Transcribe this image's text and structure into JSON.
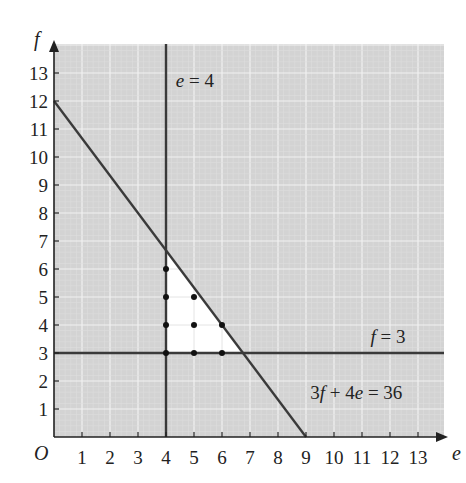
{
  "chart_data": {
    "type": "line",
    "title": "",
    "xlabel": "e",
    "ylabel": "f",
    "origin_label": "O",
    "xlim": [
      0,
      13.9
    ],
    "ylim": [
      0,
      13.9
    ],
    "x_ticks": [
      1,
      2,
      3,
      4,
      5,
      6,
      7,
      8,
      9,
      10,
      11,
      12,
      13
    ],
    "y_ticks": [
      1,
      2,
      3,
      4,
      5,
      6,
      7,
      8,
      9,
      10,
      11,
      12,
      13
    ],
    "grid": true,
    "legend": null,
    "lines": [
      {
        "name": "e = 4",
        "label": "e = 4",
        "type": "vertical",
        "x": 4,
        "label_pos": [
          4.35,
          12.5
        ]
      },
      {
        "name": "f = 3",
        "label": "f = 3",
        "type": "horizontal",
        "y": 3,
        "label_pos": [
          11.3,
          3.35
        ]
      },
      {
        "name": "3f + 4e = 36",
        "label": "3f + 4e = 36",
        "type": "segment",
        "points": [
          [
            0,
            12
          ],
          [
            9,
            0
          ]
        ],
        "label_pos": [
          9.15,
          1.35
        ]
      }
    ],
    "feasible_region": {
      "fill": "#ffffff",
      "vertices": [
        [
          4,
          3
        ],
        [
          6.75,
          3
        ],
        [
          4,
          6.6667
        ]
      ]
    },
    "points": [
      [
        4,
        3
      ],
      [
        4,
        4
      ],
      [
        4,
        5
      ],
      [
        4,
        6
      ],
      [
        5,
        3
      ],
      [
        5,
        4
      ],
      [
        5,
        5
      ],
      [
        6,
        3
      ],
      [
        6,
        4
      ]
    ],
    "colors": {
      "background": "#d3d3d3",
      "minor_grid": "#dedede",
      "major_grid": "#f2f2f2",
      "line": "#3a3a3a",
      "point": "#111111",
      "axis": "#222222"
    }
  }
}
